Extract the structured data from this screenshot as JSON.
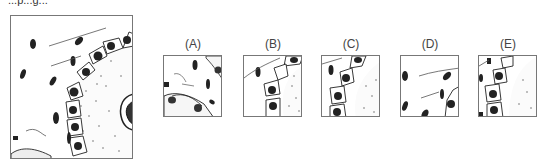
{
  "question": {
    "header_fragment": "...p...g..."
  },
  "main_figure": {
    "description": "histology-drawing-follicle-with-epithelium"
  },
  "options": [
    {
      "label": "(A)",
      "description": "lower-left-corner-cells"
    },
    {
      "label": "(B)",
      "description": "epithelial-chain-diagonal"
    },
    {
      "label": "(C)",
      "description": "epithelial-chain-diagonal-variant"
    },
    {
      "label": "(D)",
      "description": "scattered-nuclei-fibers"
    },
    {
      "label": "(E)",
      "description": "epithelial-chain-with-stroma"
    }
  ]
}
